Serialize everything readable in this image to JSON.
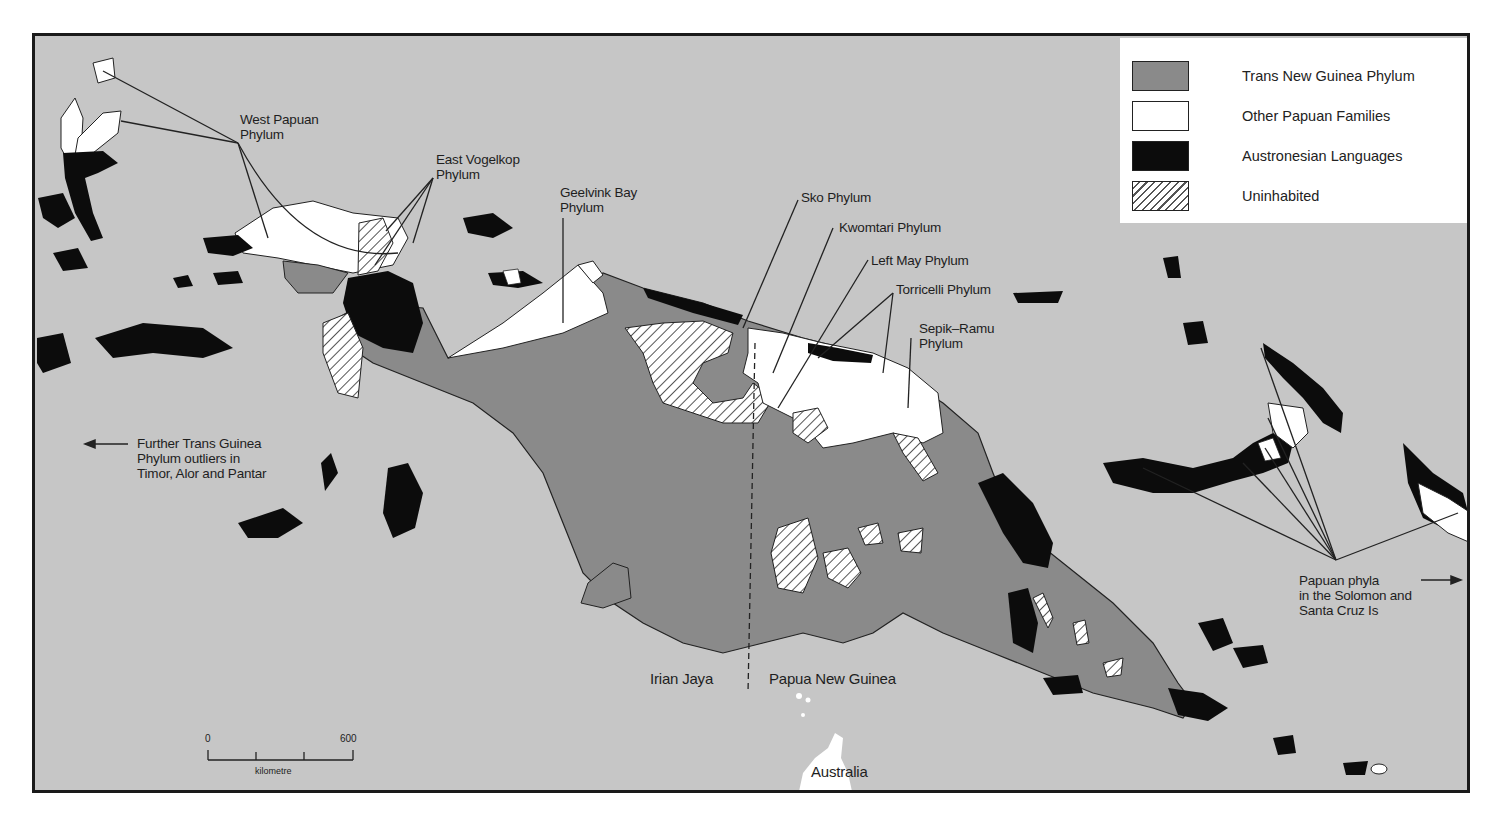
{
  "legend": {
    "items": [
      {
        "label": "Trans New Guinea Phylum",
        "swatch": "dark-grey-fill",
        "color": "#8a8a8a"
      },
      {
        "label": "Other Papuan Families",
        "swatch": "white-fill",
        "color": "#ffffff"
      },
      {
        "label": "Austronesian Languages",
        "swatch": "black-fill",
        "color": "#0c0c0c"
      },
      {
        "label": "Uninhabited",
        "swatch": "hatched",
        "color": "#ffffff"
      }
    ]
  },
  "labels": {
    "west_papuan": [
      "West Papuan",
      "Phylum"
    ],
    "east_vogelkop": [
      "East Vogelkop",
      "Phylum"
    ],
    "geelvink_bay": [
      "Geelvink Bay",
      "Phylum"
    ],
    "sko": "Sko Phylum",
    "kwomtari": "Kwomtari Phylum",
    "left_may": "Left May Phylum",
    "torricelli": "Torricelli Phylum",
    "sepik_ramu": [
      "Sepik–Ramu",
      "Phylum"
    ],
    "further_tng": [
      "Further Trans Guinea",
      "Phylum outliers in",
      "Timor, Alor and Pantar"
    ],
    "papuan_solomon": [
      "Papuan phyla",
      "in the Solomon and",
      "Santa Cruz Is"
    ],
    "irian_jaya": "Irian Jaya",
    "png": "Papua New Guinea",
    "australia": "Australia"
  },
  "scale": {
    "start": "0",
    "end": "600",
    "unit": "kilometre"
  },
  "colors": {
    "sea": "#c6c6c6",
    "trans_new_guinea": "#8a8a8a",
    "other_papuan": "#ffffff",
    "austronesian": "#0c0c0c",
    "frame": "#1a1a1a"
  }
}
